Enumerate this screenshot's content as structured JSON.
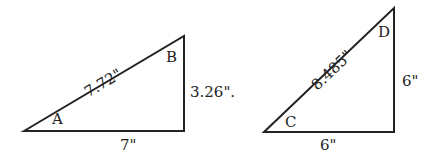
{
  "triangles": [
    {
      "angle_acute": "A",
      "angle_other": "B",
      "hypotenuse": "7.72\"",
      "vertical_side": "3.26\".",
      "base": "7\""
    },
    {
      "angle_acute": "C",
      "angle_other": "D",
      "hypotenuse": "8.485\"",
      "vertical_side": "6\"",
      "base": "6\""
    }
  ]
}
